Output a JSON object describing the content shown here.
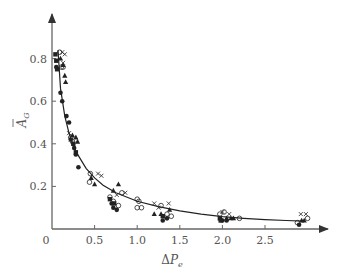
{
  "chart_data": {
    "type": "scatter",
    "title": "",
    "xlabel": "ΔP_e",
    "ylabel": "Ā_G",
    "xlim": [
      0,
      3.1
    ],
    "ylim": [
      0,
      0.9
    ],
    "grid": false,
    "legend": "none",
    "x_ticks": [
      "0",
      "0.5",
      "1.0",
      "1.5",
      "2.0",
      "2.5"
    ],
    "y_ticks": [
      "0.2",
      "0.4",
      "0.6",
      "0.8"
    ],
    "colors": {
      "axis": "#666666",
      "curve": "#222222",
      "marker": "#222222"
    },
    "fit_curve": {
      "name": "fitted curve",
      "x": [
        0.07,
        0.1,
        0.15,
        0.2,
        0.25,
        0.3,
        0.4,
        0.5,
        0.6,
        0.75,
        1.0,
        1.25,
        1.5,
        1.75,
        2.0,
        2.25,
        2.5,
        2.75,
        2.95
      ],
      "y": [
        0.84,
        0.66,
        0.53,
        0.45,
        0.39,
        0.35,
        0.285,
        0.24,
        0.205,
        0.17,
        0.13,
        0.105,
        0.085,
        0.07,
        0.058,
        0.05,
        0.044,
        0.04,
        0.037
      ]
    },
    "series": [
      {
        "name": "filled circle",
        "marker": "filled-circle",
        "points": [
          [
            0.05,
            0.76
          ],
          [
            0.1,
            0.64
          ],
          [
            0.12,
            0.6
          ],
          [
            0.17,
            0.53
          ],
          [
            0.2,
            0.5
          ],
          [
            0.22,
            0.42
          ],
          [
            0.26,
            0.38
          ],
          [
            0.28,
            0.35
          ],
          [
            0.31,
            0.29
          ],
          [
            0.7,
            0.12
          ],
          [
            0.72,
            0.1
          ],
          [
            0.76,
            0.09
          ],
          [
            1.3,
            0.04
          ],
          [
            1.35,
            0.05
          ],
          [
            2.0,
            0.04
          ],
          [
            2.05,
            0.04
          ],
          [
            2.9,
            0.02
          ]
        ]
      },
      {
        "name": "filled square",
        "marker": "filled-square",
        "points": [
          [
            0.04,
            0.82
          ],
          [
            0.05,
            0.79
          ],
          [
            0.06,
            0.75
          ],
          [
            0.25,
            0.4
          ],
          [
            0.28,
            0.36
          ],
          [
            0.68,
            0.14
          ],
          [
            0.73,
            0.12
          ],
          [
            1.3,
            0.06
          ],
          [
            1.97,
            0.05
          ],
          [
            1.98,
            0.04
          ]
        ]
      },
      {
        "name": "open circle",
        "marker": "open-circle",
        "points": [
          [
            0.09,
            0.83
          ],
          [
            0.11,
            0.76
          ],
          [
            0.13,
            0.76
          ],
          [
            0.22,
            0.43
          ],
          [
            0.24,
            0.41
          ],
          [
            0.45,
            0.26
          ],
          [
            0.44,
            0.22
          ],
          [
            0.68,
            0.15
          ],
          [
            0.72,
            0.13
          ],
          [
            0.78,
            0.11
          ],
          [
            0.82,
            0.17
          ],
          [
            1.0,
            0.14
          ],
          [
            1.02,
            0.13
          ],
          [
            1.0,
            0.1
          ],
          [
            1.05,
            0.1
          ],
          [
            1.28,
            0.11
          ],
          [
            1.35,
            0.07
          ],
          [
            1.4,
            0.06
          ],
          [
            1.97,
            0.07
          ],
          [
            2.02,
            0.08
          ],
          [
            2.2,
            0.05
          ],
          [
            2.88,
            0.03
          ],
          [
            3.0,
            0.05
          ]
        ]
      },
      {
        "name": "filled triangle",
        "marker": "filled-triangle",
        "points": [
          [
            0.1,
            0.8
          ],
          [
            0.13,
            0.77
          ],
          [
            0.15,
            0.72
          ],
          [
            0.16,
            0.69
          ],
          [
            0.24,
            0.44
          ],
          [
            0.28,
            0.43
          ],
          [
            0.3,
            0.41
          ],
          [
            0.46,
            0.24
          ],
          [
            0.5,
            0.21
          ],
          [
            0.72,
            0.18
          ],
          [
            0.78,
            0.21
          ],
          [
            1.2,
            0.07
          ],
          [
            1.28,
            0.07
          ],
          [
            1.38,
            0.09
          ],
          [
            2.05,
            0.05
          ],
          [
            2.1,
            0.05
          ],
          [
            2.13,
            0.05
          ],
          [
            2.93,
            0.04
          ],
          [
            2.96,
            0.04
          ]
        ]
      },
      {
        "name": "cross",
        "marker": "cross",
        "points": [
          [
            0.12,
            0.83
          ],
          [
            0.15,
            0.82
          ],
          [
            0.13,
            0.78
          ],
          [
            0.2,
            0.45
          ],
          [
            0.22,
            0.42
          ],
          [
            0.54,
            0.26
          ],
          [
            0.58,
            0.25
          ],
          [
            0.76,
            0.16
          ],
          [
            0.86,
            0.17
          ],
          [
            1.2,
            0.12
          ],
          [
            1.25,
            0.1
          ],
          [
            1.37,
            0.12
          ],
          [
            2.0,
            0.08
          ],
          [
            2.08,
            0.07
          ],
          [
            2.92,
            0.07
          ],
          [
            2.98,
            0.07
          ]
        ]
      }
    ]
  }
}
